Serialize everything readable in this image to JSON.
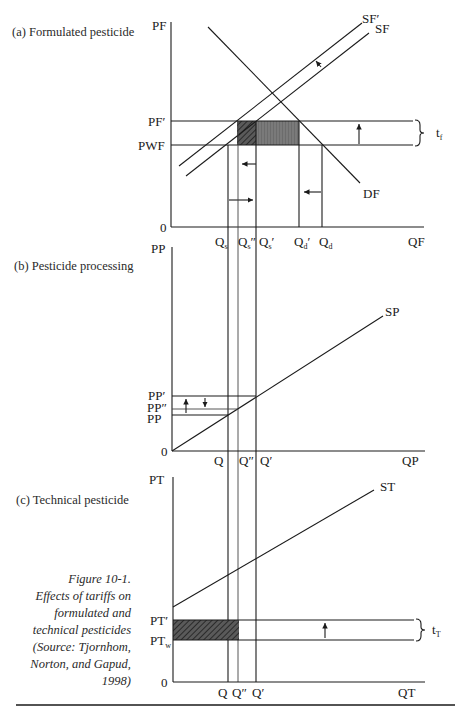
{
  "figure": {
    "title": "Figure 10-1.",
    "caption_lines": [
      "Figure 10-1.",
      "Effects of tariffs on",
      "formulated and",
      "technical pesticides",
      "(Source: Tjornhom,",
      "Norton, and Gapud,",
      "1998)"
    ]
  },
  "panels": {
    "a": {
      "title": "(a) Formulated pesticide",
      "y_axis": "PF",
      "x_axis": "QF",
      "origin": "0",
      "price_labels": {
        "high": "PF′",
        "low": "PWF"
      },
      "curves": {
        "supply_shifted": "SF′",
        "supply": "SF",
        "demand": "DF"
      },
      "q_labels": {
        "qs": "Q",
        "qs_sub": "s",
        "qs2": "Q",
        "qs2_sub": "s",
        "qs2_mark": "″",
        "qs1": "Q",
        "qs1_sub": "s",
        "qs1_mark": "′",
        "qd1": "Q",
        "qd1_sub": "d",
        "qd1_mark": "′",
        "qd": "Q",
        "qd_sub": "d"
      },
      "tariff": {
        "label": "t",
        "sub": "f"
      }
    },
    "b": {
      "title": "(b) Pesticide processing",
      "y_axis": "PP",
      "x_axis": "QP",
      "origin": "0",
      "price_labels": {
        "high": "PP′",
        "mid": "PP″",
        "low": "PP"
      },
      "curves": {
        "supply": "SP"
      },
      "q_labels": {
        "q": "Q",
        "q2": "Q″",
        "q1": "Q′"
      }
    },
    "c": {
      "title": "(c) Technical pesticide",
      "y_axis": "PT",
      "x_axis": "QT",
      "origin": "0",
      "price_labels": {
        "high": "PT′",
        "low": "PT",
        "low_sub": "w"
      },
      "curves": {
        "supply": "ST"
      },
      "q_labels": {
        "q": "Q",
        "q2": "Q″",
        "q1": "Q′"
      },
      "tariff": {
        "label": "t",
        "sub": "T"
      }
    }
  },
  "colors": {
    "ink": "#1a1a1a",
    "hatch_dark": "#3a3a3a",
    "fill_gray": "#6e6e6e"
  }
}
